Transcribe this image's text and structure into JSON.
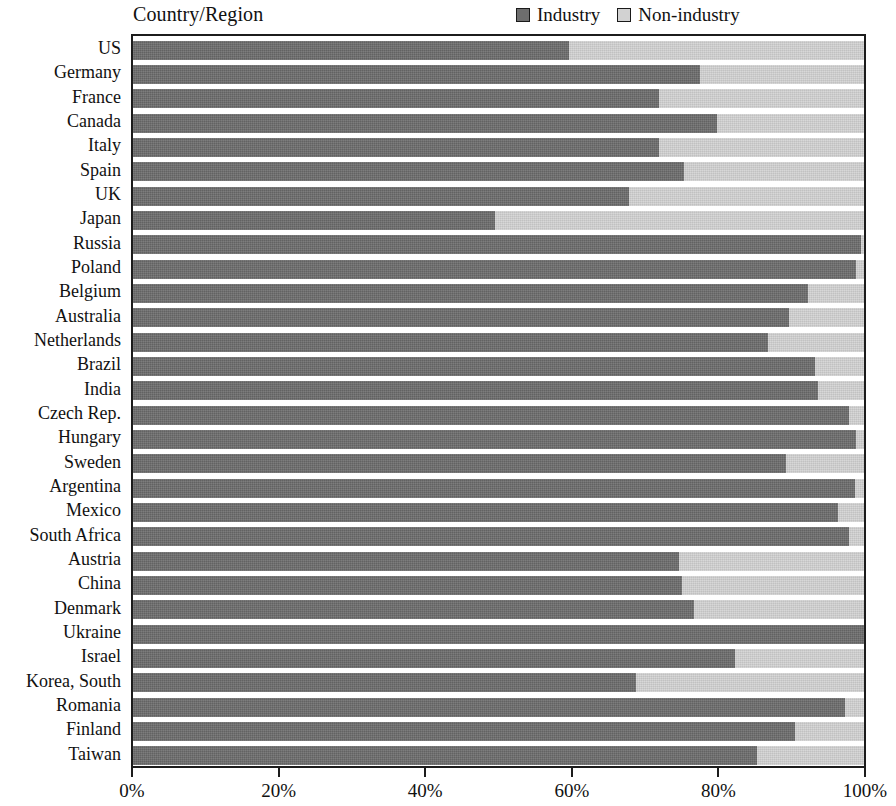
{
  "axis_title": "Country/Region",
  "legend": {
    "items": [
      {
        "label": "Industry",
        "color": "#6e6e6e",
        "name": "industry"
      },
      {
        "label": "Non-industry",
        "color": "#d2d2d2",
        "name": "non-industry"
      }
    ]
  },
  "x_axis": {
    "ticks": [
      "0%",
      "20%",
      "40%",
      "60%",
      "80%",
      "100%"
    ],
    "tick_values": [
      0,
      20,
      40,
      60,
      80,
      100
    ]
  },
  "chart_data": {
    "type": "bar",
    "orientation": "horizontal",
    "stacked": true,
    "normalized_percent": true,
    "title": "",
    "subtitle": "",
    "xlabel": "",
    "ylabel": "Country/Region",
    "xlim": [
      0,
      100
    ],
    "grid": false,
    "legend_position": "top-right",
    "categories": [
      "US",
      "Germany",
      "France",
      "Canada",
      "Italy",
      "Spain",
      "UK",
      "Japan",
      "Russia",
      "Poland",
      "Belgium",
      "Australia",
      "Netherlands",
      "Brazil",
      "India",
      "Czech Rep.",
      "Hungary",
      "Sweden",
      "Argentina",
      "Mexico",
      "South Africa",
      "Austria",
      "China",
      "Denmark",
      "Ukraine",
      "Israel",
      "Korea, South",
      "Romania",
      "Finland",
      "Taiwan"
    ],
    "series": [
      {
        "name": "Industry",
        "color": "#6e6e6e",
        "values": [
          59.7,
          77.6,
          72.0,
          79.9,
          72.0,
          75.4,
          67.9,
          49.5,
          99.6,
          98.9,
          92.4,
          89.7,
          86.9,
          93.3,
          93.7,
          98.0,
          98.9,
          89.3,
          98.8,
          96.5,
          98.0,
          74.7,
          75.1,
          76.7,
          100.0,
          82.3,
          68.8,
          97.4,
          90.6,
          85.3
        ]
      },
      {
        "name": "Non-industry",
        "color": "#d2d2d2",
        "values": [
          40.3,
          22.4,
          28.0,
          20.1,
          28.0,
          24.6,
          32.1,
          50.5,
          0.4,
          1.1,
          7.6,
          10.3,
          13.1,
          6.7,
          6.3,
          2.0,
          1.1,
          10.7,
          1.2,
          3.5,
          2.0,
          25.3,
          24.9,
          23.3,
          0.0,
          17.7,
          31.2,
          2.6,
          9.4,
          14.7
        ]
      }
    ]
  }
}
